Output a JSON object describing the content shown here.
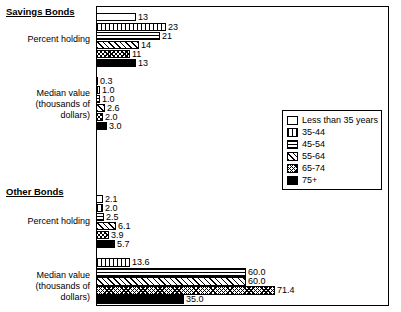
{
  "chart_data": {
    "type": "bar",
    "title": "",
    "xlabel": "",
    "ylabel": "",
    "orientation": "horizontal",
    "legend_position": "middle-right",
    "grid": false,
    "legend": [
      "Less than 35 years",
      "35-44",
      "45-54",
      "55-64",
      "65-74",
      "75+"
    ],
    "groups": [
      {
        "title": "Savings Bonds",
        "categories": [
          {
            "label": "Percent holding",
            "values": [
              13,
              23,
              21,
              14,
              11,
              13
            ]
          },
          {
            "label": "Median value (thousands of dollars)",
            "label_line1": "Median value",
            "label_line2": "(thousands of",
            "label_line3": "dollars)",
            "values": [
              0.3,
              1.0,
              1.0,
              2.6,
              2.0,
              3.0
            ]
          }
        ]
      },
      {
        "title": "Other Bonds",
        "categories": [
          {
            "label": "Percent holding",
            "values": [
              2.1,
              2.0,
              2.5,
              6.1,
              3.9,
              5.7
            ]
          },
          {
            "label": "Median value (thousands of dollars)",
            "label_line1": "Median value",
            "label_line2": "(thousands of",
            "label_line3": "dollars)",
            "values": [
              13.6,
              60.0,
              60.0,
              71.4,
              35.0
            ]
          }
        ]
      }
    ],
    "bars": [
      {
        "name": "savings-pct-lt35",
        "group": "Savings Bonds",
        "series": "Less than 35 years",
        "value": "13",
        "len": 40,
        "fill": "f0",
        "x": 96,
        "y": 13,
        "h": 8
      },
      {
        "name": "savings-pct-35-44",
        "group": "Savings Bonds",
        "series": "35-44",
        "value": "23",
        "len": 70,
        "fill": "f1",
        "x": 96,
        "y": 23,
        "h": 8
      },
      {
        "name": "savings-pct-45-54",
        "group": "Savings Bonds",
        "series": "45-54",
        "value": "21",
        "len": 64,
        "fill": "f2",
        "x": 96,
        "y": 32,
        "h": 8
      },
      {
        "name": "savings-pct-55-64",
        "group": "Savings Bonds",
        "series": "55-64",
        "value": "14",
        "len": 43,
        "fill": "f3",
        "x": 96,
        "y": 41,
        "h": 8
      },
      {
        "name": "savings-pct-65-74",
        "group": "Savings Bonds",
        "series": "65-74",
        "value": "11",
        "len": 34,
        "fill": "f4",
        "x": 96,
        "y": 50,
        "h": 8
      },
      {
        "name": "savings-pct-75plus",
        "group": "Savings Bonds",
        "series": "75+",
        "value": "13",
        "len": 40,
        "fill": "f5",
        "x": 96,
        "y": 59,
        "h": 8
      },
      {
        "name": "savings-med-lt35",
        "group": "Savings Bonds",
        "series": "Less than 35 years",
        "value": "0.3",
        "len": 2,
        "fill": "f0",
        "x": 96,
        "y": 77,
        "h": 8
      },
      {
        "name": "savings-med-35-44",
        "group": "Savings Bonds",
        "series": "35-44",
        "value": "1.0",
        "len": 4,
        "fill": "f1",
        "x": 96,
        "y": 86,
        "h": 8
      },
      {
        "name": "savings-med-45-54",
        "group": "Savings Bonds",
        "series": "45-54",
        "value": "1.0",
        "len": 4,
        "fill": "f2",
        "x": 96,
        "y": 95,
        "h": 8
      },
      {
        "name": "savings-med-55-64",
        "group": "Savings Bonds",
        "series": "55-64",
        "value": "2.6",
        "len": 9,
        "fill": "f3",
        "x": 96,
        "y": 104,
        "h": 8
      },
      {
        "name": "savings-med-65-74",
        "group": "Savings Bonds",
        "series": "65-74",
        "value": "2.0",
        "len": 7,
        "fill": "f4",
        "x": 96,
        "y": 113,
        "h": 8
      },
      {
        "name": "savings-med-75plus",
        "group": "Savings Bonds",
        "series": "75+",
        "value": "3.0",
        "len": 11,
        "fill": "f5",
        "x": 96,
        "y": 122,
        "h": 8
      },
      {
        "name": "other-pct-lt35",
        "group": "Other Bonds",
        "series": "Less than 35 years",
        "value": "2.1",
        "len": 7,
        "fill": "f0",
        "x": 96,
        "y": 195,
        "h": 8
      },
      {
        "name": "other-pct-35-44",
        "group": "Other Bonds",
        "series": "35-44",
        "value": "2.0",
        "len": 7,
        "fill": "f1",
        "x": 96,
        "y": 204,
        "h": 8
      },
      {
        "name": "other-pct-45-54",
        "group": "Other Bonds",
        "series": "45-54",
        "value": "2.5",
        "len": 8,
        "fill": "f2",
        "x": 96,
        "y": 213,
        "h": 8
      },
      {
        "name": "other-pct-55-64",
        "group": "Other Bonds",
        "series": "55-64",
        "value": "6.1",
        "len": 20,
        "fill": "f3",
        "x": 96,
        "y": 222,
        "h": 8
      },
      {
        "name": "other-pct-65-74",
        "group": "Other Bonds",
        "series": "65-74",
        "value": "3.9",
        "len": 13,
        "fill": "f4",
        "x": 96,
        "y": 231,
        "h": 8
      },
      {
        "name": "other-pct-75plus",
        "group": "Other Bonds",
        "series": "75+",
        "value": "5.7",
        "len": 19,
        "fill": "f5",
        "x": 96,
        "y": 240,
        "h": 8
      },
      {
        "name": "other-med-lt35",
        "group": "Other Bonds",
        "series": "Less than 35 years",
        "value": "13.6",
        "len": 34,
        "fill": "f1",
        "x": 96,
        "y": 258,
        "h": 9
      },
      {
        "name": "other-med-45-54",
        "group": "Other Bonds",
        "series": "45-54",
        "value": "60.0",
        "len": 150,
        "fill": "f2",
        "x": 96,
        "y": 268,
        "h": 9
      },
      {
        "name": "other-med-55-64",
        "group": "Other Bonds",
        "series": "55-64",
        "value": "60.0",
        "len": 150,
        "fill": "f3",
        "x": 96,
        "y": 277,
        "h": 9
      },
      {
        "name": "other-med-65-74",
        "group": "Other Bonds",
        "series": "65-74",
        "value": "71.4",
        "len": 179,
        "fill": "f4",
        "x": 96,
        "y": 286,
        "h": 9
      },
      {
        "name": "other-med-75plus",
        "group": "Other Bonds",
        "series": "75+",
        "value": "35.0",
        "len": 88,
        "fill": "f5",
        "x": 96,
        "y": 295,
        "h": 9
      }
    ]
  },
  "labels": {
    "savings_title": "Savings Bonds",
    "other_title": "Other Bonds",
    "percent_holding": "Percent holding",
    "median_l1": "Median value",
    "median_l2": "(thousands of",
    "median_l3": "dollars)"
  }
}
